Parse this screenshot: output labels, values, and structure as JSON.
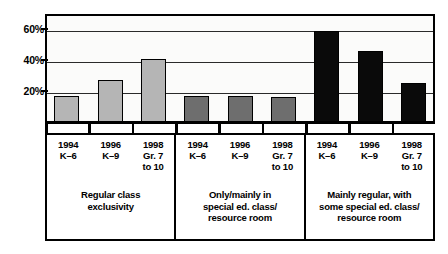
{
  "chart_data": {
    "type": "bar",
    "title": "",
    "subtitle": "",
    "xlabel": "",
    "ylabel": "",
    "ylim": [
      0,
      70
    ],
    "grid": true,
    "legend_position": "none",
    "ytick_labels": [
      "60%",
      "40%",
      "20%"
    ],
    "ytick_values": [
      60,
      40,
      20
    ],
    "categories": [
      "1994 K–6",
      "1996 K–9",
      "1998 Gr. 7 to 10",
      "1994 K–6",
      "1996 K–9",
      "1998 Gr. 7 to 10",
      "1994 K–6",
      "1996 K–9",
      "1998 Gr. 7 to 10"
    ],
    "values": [
      17,
      27,
      41,
      17,
      17,
      16,
      59,
      46,
      25
    ],
    "groups": [
      {
        "name": "Regular class exclusivity",
        "color": "#b5b5b5",
        "categories": [
          "1994 K–6",
          "1996 K–9",
          "1998 Gr. 7 to 10"
        ],
        "values": [
          17,
          27,
          41
        ]
      },
      {
        "name": "Only/mainly in special ed. class/ resource room",
        "color": "#6e6e6e",
        "categories": [
          "1994 K–6",
          "1996 K–9",
          "1998 Gr. 7 to 10"
        ],
        "values": [
          17,
          17,
          16
        ]
      },
      {
        "name": "Mainly regular, with some special ed. class/ resource room",
        "color": "#0a0a0a",
        "categories": [
          "1994 K–6",
          "1996 K–9",
          "1998 Gr. 7 to 10"
        ],
        "values": [
          59,
          46,
          25
        ]
      }
    ]
  },
  "axis": {
    "yticks": [
      {
        "label": "60%",
        "value": 60
      },
      {
        "label": "40%",
        "value": 40
      },
      {
        "label": "20%",
        "value": 20
      }
    ]
  },
  "legend_table": {
    "groups": [
      {
        "years": [
          {
            "year": "1994",
            "grade": "K–6"
          },
          {
            "year": "1996",
            "grade": "K–9"
          },
          {
            "year": "1998",
            "grade": "Gr. 7\nto 10"
          }
        ],
        "title": "Regular class\nexclusivity"
      },
      {
        "years": [
          {
            "year": "1994",
            "grade": "K–6"
          },
          {
            "year": "1996",
            "grade": "K–9"
          },
          {
            "year": "1998",
            "grade": "Gr. 7\nto 10"
          }
        ],
        "title": "Only/mainly in\nspecial ed. class/\nresource room"
      },
      {
        "years": [
          {
            "year": "1994",
            "grade": "K–6"
          },
          {
            "year": "1996",
            "grade": "K–9"
          },
          {
            "year": "1998",
            "grade": "Gr. 7\nto 10"
          }
        ],
        "title": "Mainly regular, with\nsome special ed. class/\nresource room"
      }
    ]
  },
  "colors": {
    "group1": "#b5b5b5",
    "group2": "#6e6e6e",
    "group3": "#0a0a0a",
    "axis": "#000000",
    "grid": "#2a2a2a",
    "plot_background": "#fbfbfa",
    "page_background": "#ffffff"
  }
}
